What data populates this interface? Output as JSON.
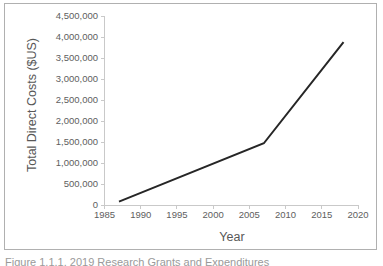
{
  "figure": {
    "caption": "Figure 1.1.1. 2019 Research Grants and Expenditures",
    "border_color": "#b0b0b0"
  },
  "chart_data": {
    "type": "line",
    "title": "",
    "xlabel": "Year",
    "ylabel": "Total Direct Costs ($US)",
    "xlim": [
      1985,
      2020
    ],
    "ylim": [
      0,
      4500000
    ],
    "grid": false,
    "legend": false,
    "line_color": "#262626",
    "line_width": 2,
    "x_ticks": [
      1985,
      1990,
      1995,
      2000,
      2005,
      2010,
      2015,
      2020
    ],
    "x_tick_labels": [
      "1985",
      "1990",
      "1995",
      "2000",
      "2005",
      "2010",
      "2015",
      "2020"
    ],
    "y_ticks": [
      0,
      500000,
      1000000,
      1500000,
      2000000,
      2500000,
      3000000,
      3500000,
      4000000,
      4500000
    ],
    "y_tick_labels": [
      "0",
      "500,000",
      "1,000,000",
      "1,500,000",
      "2,000,000",
      "2,500,000",
      "3,000,000",
      "3,500,000",
      "4,000,000",
      "4,500,000"
    ],
    "series": [
      {
        "name": "Total Direct Costs",
        "x": [
          1987,
          2007,
          2018
        ],
        "values": [
          80000,
          1470000,
          3880000
        ]
      }
    ]
  }
}
